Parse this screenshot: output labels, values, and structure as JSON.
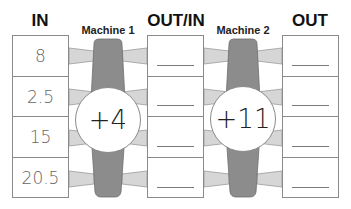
{
  "headers": {
    "in": "IN",
    "machine1": "Machine 1",
    "out_in": "OUT/IN",
    "machine2": "Machine 2",
    "out": "OUT"
  },
  "in_values": [
    "8",
    "2.5",
    "15",
    "20.5"
  ],
  "out_in_values": [
    "",
    "",
    "",
    ""
  ],
  "out_values": [
    "",
    "",
    "",
    ""
  ],
  "machines": [
    {
      "label": "Machine 1",
      "rule": "+4"
    },
    {
      "label": "Machine 2",
      "rule": "+11"
    }
  ],
  "colors": {
    "machine_body": "#8c8c8c",
    "connector": "#d6d6d6",
    "border": "#8a8a8a"
  }
}
